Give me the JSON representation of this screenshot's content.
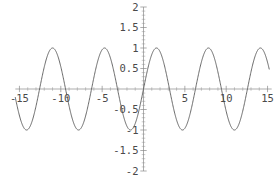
{
  "chart_data": {
    "type": "line",
    "title": "",
    "subtitle": "",
    "xlabel": "",
    "ylabel": "",
    "function": "sin(x)",
    "xlim": [
      -15.5,
      15.5
    ],
    "ylim": [
      -2,
      2
    ],
    "grid": false,
    "legend": null,
    "xticks": [
      -15,
      -10,
      -5,
      5,
      10,
      15
    ],
    "xtick_labels": [
      "-15",
      "-10",
      "-5",
      "5",
      "10",
      "15"
    ],
    "yticks": [
      2,
      1.5,
      1,
      0.5,
      -0.5,
      -1,
      -1.5,
      -2
    ],
    "ytick_labels": [
      "2",
      "1.5",
      "1",
      "0.5",
      "-0.5",
      "-1",
      "-1.5",
      "-2"
    ],
    "x_minor_step": 1,
    "y_minor_step": 0.1,
    "series": [
      {
        "name": "sin(x)",
        "color": "#5a5a5a",
        "amplitude": 1,
        "period": 6.283185307,
        "phase": 0,
        "x_start": -15.5,
        "x_end": 15.2,
        "samples": 900
      }
    ],
    "annotations": [],
    "axis_color": "#8a8a8a",
    "label_color": "#4a4a4a",
    "background": "#ffffff"
  },
  "geometry": {
    "width": 279,
    "height": 191,
    "origin_x_px": 143.5,
    "origin_y_px": 89,
    "x_scale_px_per_unit": 8.27,
    "y_scale_px_per_unit": 41.0
  }
}
